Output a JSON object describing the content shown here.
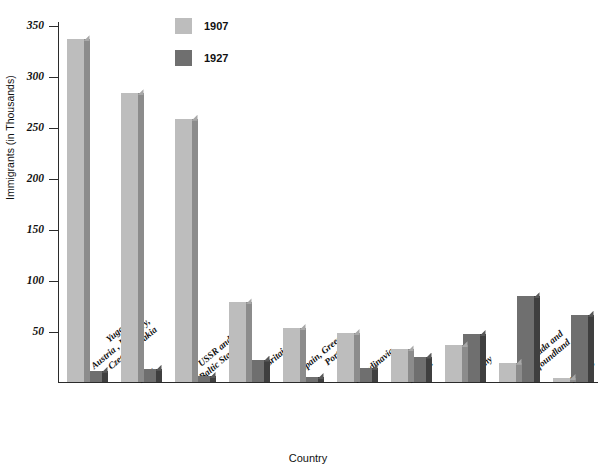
{
  "chart_data": {
    "type": "bar",
    "title": "",
    "xlabel": "Country",
    "ylabel": "Immigrants (in Thousands)",
    "ylim": [
      0,
      350
    ],
    "yticks": [
      350,
      300,
      250,
      200,
      150,
      100,
      50
    ],
    "grid": false,
    "legend_position": "top-center",
    "categories": [
      "Yugoslavia, Austria , Hungary, Czechoslovakia",
      "Italy",
      "USSR and Baltic States",
      "Great Britain",
      "Spain, Greece, Portugal",
      "Scandinavia",
      "Ireland",
      "Germany",
      "Canada and Newfoundland",
      "Mexico"
    ],
    "category_lines": [
      [
        "Yugoslavia,",
        "Austria , Hungary,",
        "Czechoslovakia"
      ],
      [
        "Italy"
      ],
      [
        "USSR and",
        "Baltic States"
      ],
      [
        "Great Britain"
      ],
      [
        "Spain, Greece,",
        "Portugal"
      ],
      [
        "Scandinavia"
      ],
      [
        "Ireland"
      ],
      [
        "Germany"
      ],
      [
        "Canada and",
        "Newfoundland"
      ],
      [
        "Mexico"
      ]
    ],
    "series": [
      {
        "name": "1907",
        "color": "#bdbdbd",
        "values": [
          336,
          283,
          258,
          78,
          53,
          48,
          32,
          36,
          19,
          4
        ]
      },
      {
        "name": "1927",
        "color": "#6f6f6f",
        "values": [
          11,
          13,
          6,
          22,
          5,
          14,
          25,
          47,
          84,
          66
        ]
      }
    ]
  },
  "legend": {
    "items": [
      {
        "label": "1907",
        "color": "#bdbdbd"
      },
      {
        "label": "1927",
        "color": "#6f6f6f"
      }
    ]
  }
}
